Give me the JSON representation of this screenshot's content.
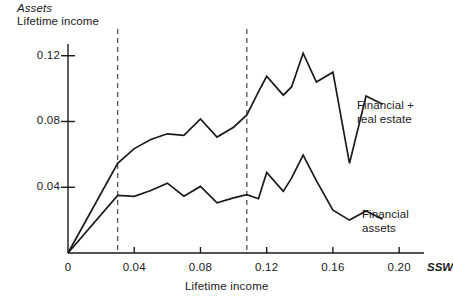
{
  "chart_data": {
    "type": "line",
    "title": "",
    "ylabel_numerator": "Assets",
    "ylabel_denominator": "Lifetime income",
    "xlabel": "Lifetime income",
    "x_axis_variable": "SSW",
    "xlim": [
      0,
      0.215
    ],
    "ylim": [
      0,
      0.132
    ],
    "xticks": [
      0,
      0.04,
      0.08,
      0.12,
      0.16,
      0.2
    ],
    "xtick_labels": [
      "0",
      "0.04",
      "0.08",
      "0.12",
      "0.16",
      "0.20"
    ],
    "yticks": [
      0.04,
      0.08,
      0.12
    ],
    "ytick_labels": [
      "0.04",
      "0.08",
      "0.12"
    ],
    "grid": false,
    "legend_position": "inline-right",
    "line_color": "#1a1a1a",
    "annotations": [
      {
        "name": "vline-low",
        "type": "vertical-dashed-line",
        "x": 0.03
      },
      {
        "name": "vline-high",
        "type": "vertical-dashed-line",
        "x": 0.108
      }
    ],
    "series": [
      {
        "name": "Financial + real estate",
        "label_line1": "Financial +",
        "label_line2": "real estate",
        "x": [
          0.0,
          0.03,
          0.04,
          0.05,
          0.06,
          0.07,
          0.08,
          0.09,
          0.1,
          0.108,
          0.115,
          0.12,
          0.13,
          0.135,
          0.142,
          0.15,
          0.16,
          0.17,
          0.18,
          0.19
        ],
        "values": [
          0.0,
          0.0545,
          0.0635,
          0.069,
          0.0725,
          0.0715,
          0.0815,
          0.0705,
          0.0765,
          0.084,
          0.098,
          0.1075,
          0.096,
          0.101,
          0.1215,
          0.104,
          0.11,
          0.0545,
          0.0955,
          0.0905
        ]
      },
      {
        "name": "Financial assets",
        "label_line1": "Financial",
        "label_line2": "assets",
        "x": [
          0.0,
          0.03,
          0.04,
          0.05,
          0.06,
          0.07,
          0.08,
          0.09,
          0.1,
          0.108,
          0.115,
          0.12,
          0.13,
          0.135,
          0.142,
          0.15,
          0.16,
          0.17,
          0.18,
          0.19
        ],
        "values": [
          0.0,
          0.035,
          0.0345,
          0.038,
          0.0425,
          0.0345,
          0.0405,
          0.0305,
          0.0335,
          0.0355,
          0.033,
          0.049,
          0.0375,
          0.0455,
          0.0595,
          0.044,
          0.026,
          0.02,
          0.0255,
          0.0205
        ]
      }
    ]
  },
  "labels": {
    "ssw": "SSW"
  }
}
